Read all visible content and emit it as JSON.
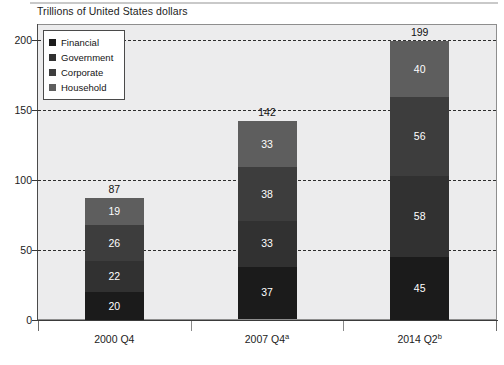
{
  "chart_data": {
    "type": "bar",
    "subtype": "stacked-bar",
    "title": "Trillions of United States dollars",
    "xlabel": "",
    "ylabel": "",
    "ylim": [
      0,
      200
    ],
    "yticks": [
      0,
      50,
      100,
      150,
      200
    ],
    "ytick_labels": [
      "0",
      "50",
      "100",
      "150",
      "200"
    ],
    "grid": true,
    "grid_style": "dashed-horizontal",
    "legend_position": "top-left-inside",
    "categories": [
      "2000 Q4",
      "2007 Q4",
      "2014 Q2"
    ],
    "category_labels": [
      "2000 Q4",
      "2007 Q4a",
      "2014 Q2b"
    ],
    "category_footnotes": [
      "",
      "a",
      "b"
    ],
    "stack_order_bottom_to_top": [
      "Financial",
      "Government",
      "Corporate",
      "Household"
    ],
    "series": [
      {
        "name": "Financial",
        "color": "#1b1b1b",
        "values": [
          20,
          37,
          45
        ]
      },
      {
        "name": "Government",
        "color": "#313131",
        "values": [
          22,
          33,
          58
        ]
      },
      {
        "name": "Corporate",
        "color": "#3d3d3d",
        "values": [
          26,
          38,
          56
        ]
      },
      {
        "name": "Household",
        "color": "#5e5e5e",
        "values": [
          19,
          33,
          40
        ]
      }
    ],
    "totals": [
      87,
      142,
      199
    ],
    "total_labels": [
      "87",
      "142",
      "199"
    ],
    "colors": {
      "plot_background": "#ececed",
      "page_background": "#ffffff",
      "axis": "#3a3a3a",
      "gridline": "#2e2e2e",
      "value_label": "#ffffff",
      "total_label": "#111111"
    }
  },
  "legend": {
    "items": [
      {
        "label": "Financial",
        "color": "#1b1b1b"
      },
      {
        "label": "Government",
        "color": "#313131"
      },
      {
        "label": "Corporate",
        "color": "#3d3d3d"
      },
      {
        "label": "Household",
        "color": "#5e5e5e"
      }
    ]
  }
}
